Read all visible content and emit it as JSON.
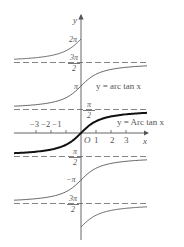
{
  "diagram": {
    "title": "",
    "axes": {
      "x_label": "x",
      "y_label": "y",
      "origin_label": "O",
      "x_ticks": [
        "-3",
        "-2",
        "-1",
        "1",
        "2",
        "3"
      ],
      "x_tick_labels": {
        "neg": "−3 −2 −1",
        "pos1": "1",
        "pos2": "2",
        "pos3": "3"
      }
    },
    "y_marks": {
      "two_pi": "2π",
      "three_pi_over_two": {
        "num": "3π",
        "den": "2"
      },
      "pi": "π",
      "pi_over_two": {
        "num": "π",
        "den": "2"
      },
      "neg_pi_over_two": {
        "num": "π",
        "den": "2"
      },
      "neg_pi": "−π",
      "neg_three_pi_over_two": {
        "num": "3π",
        "den": "2"
      }
    },
    "curve_labels": {
      "multi_valued": "y = arc tan x",
      "principal": "y = Arc tan x"
    },
    "asymptotes_in_pi_units": [
      1.5,
      0.5,
      -0.5,
      -1.5
    ],
    "branches": [
      {
        "name": "branch-2pi",
        "offset_pi": 2,
        "side": "left"
      },
      {
        "name": "branch-pi",
        "offset_pi": 1,
        "side": "both"
      },
      {
        "name": "principal",
        "offset_pi": 0,
        "side": "both",
        "bold": true
      },
      {
        "name": "branch-neg-pi",
        "offset_pi": -1,
        "side": "both"
      },
      {
        "name": "branch-neg-2pi",
        "offset_pi": -2,
        "side": "right"
      }
    ],
    "colors": {
      "line": "#555555",
      "principal": "#111111",
      "dash": "#666666"
    }
  }
}
